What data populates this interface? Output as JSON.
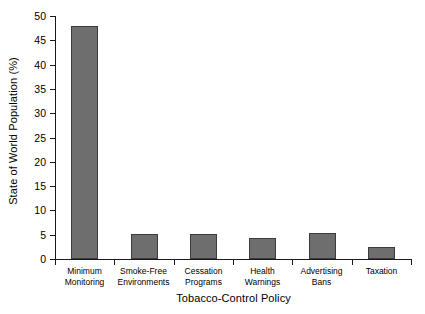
{
  "chart_data": {
    "type": "bar",
    "title": "",
    "xlabel": "Tobacco-Control Policy",
    "ylabel": "State of World Population (%)",
    "categories": [
      "Minimum Monitoring",
      "Smoke-Free Environments",
      "Cessation Programs",
      "Health Warnings",
      "Advertising Bans",
      "Taxation"
    ],
    "category_lines": [
      [
        "Minimum",
        "Monitoring"
      ],
      [
        "Smoke-Free",
        "Environments"
      ],
      [
        "Cessation",
        "Programs"
      ],
      [
        "Health Warnings",
        ""
      ],
      [
        "Advertising",
        "Bans"
      ],
      [
        "Taxation",
        ""
      ]
    ],
    "values": [
      48,
      5.2,
      5.2,
      4.3,
      5.4,
      2.4
    ],
    "ylim": [
      0,
      50
    ],
    "yticks": [
      0,
      5,
      10,
      15,
      20,
      25,
      30,
      35,
      40,
      45,
      50
    ],
    "ytick_labels": [
      "0",
      "5",
      "10",
      "15",
      "20",
      "25",
      "30",
      "35",
      "40",
      "45",
      "50"
    ],
    "grid": false,
    "legend": false,
    "bar_color": "#6e6e6e",
    "bar_edge_color": "#3c3c3c",
    "background_color": "#ffffff"
  }
}
